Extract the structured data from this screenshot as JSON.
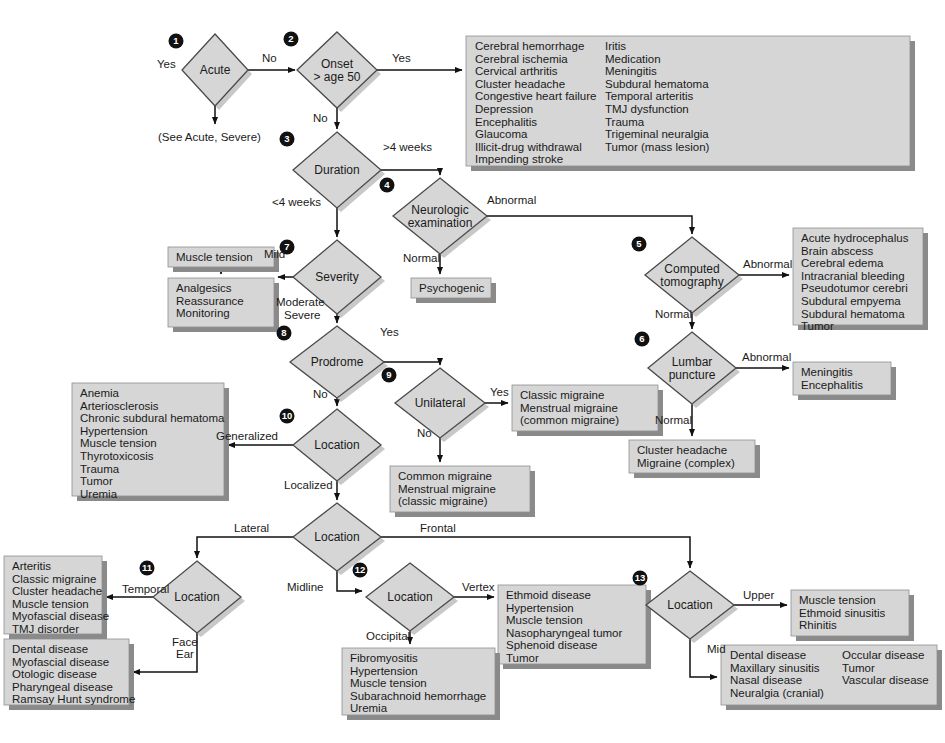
{
  "colors": {
    "shape_fill": "#d6d6d6",
    "shadow": "#8a8a8a",
    "line": "#111111",
    "badge": "#111111",
    "text": "#1a1a1a"
  },
  "diagram": {
    "type": "clinical-decision-flowchart",
    "nodes": [
      {
        "id": "acute",
        "num": "1",
        "label_lines": [
          "Acute"
        ],
        "cx": 215,
        "cy": 70,
        "rx": 33,
        "ry": 36
      },
      {
        "id": "onset",
        "num": "2",
        "label_lines": [
          "Onset",
          "> age 50"
        ],
        "cx": 337,
        "cy": 70,
        "rx": 40,
        "ry": 38
      },
      {
        "id": "duration",
        "num": "3",
        "label_lines": [
          "Duration"
        ],
        "cx": 337,
        "cy": 170,
        "rx": 44,
        "ry": 38
      },
      {
        "id": "neuro",
        "num": "4",
        "label_lines": [
          "Neurologic",
          "examination"
        ],
        "cx": 440,
        "cy": 216,
        "rx": 47,
        "ry": 38
      },
      {
        "id": "ct",
        "num": "5",
        "label_lines": [
          "Computed",
          "tomography"
        ],
        "cx": 692,
        "cy": 275,
        "rx": 47,
        "ry": 38
      },
      {
        "id": "lp",
        "num": "6",
        "label_lines": [
          "Lumbar",
          "puncture"
        ],
        "cx": 692,
        "cy": 368,
        "rx": 44,
        "ry": 36
      },
      {
        "id": "severity",
        "num": "7",
        "label_lines": [
          "Severity"
        ],
        "cx": 337,
        "cy": 277,
        "rx": 44,
        "ry": 37
      },
      {
        "id": "prodrome",
        "num": "8",
        "label_lines": [
          "Prodrome"
        ],
        "cx": 337,
        "cy": 362,
        "rx": 47,
        "ry": 36
      },
      {
        "id": "unilateral",
        "num": "9",
        "label_lines": [
          "Unilateral"
        ],
        "cx": 440,
        "cy": 403,
        "rx": 45,
        "ry": 35
      },
      {
        "id": "location10",
        "num": "10",
        "label_lines": [
          "Location"
        ],
        "cx": 337,
        "cy": 445,
        "rx": 44,
        "ry": 36
      },
      {
        "id": "location_mid",
        "num": "",
        "label_lines": [
          "Location"
        ],
        "cx": 337,
        "cy": 537,
        "rx": 44,
        "ry": 34
      },
      {
        "id": "location11",
        "num": "11",
        "label_lines": [
          "Location"
        ],
        "cx": 197,
        "cy": 597,
        "rx": 44,
        "ry": 36
      },
      {
        "id": "location12",
        "num": "12",
        "label_lines": [
          "Location"
        ],
        "cx": 410,
        "cy": 597,
        "rx": 44,
        "ry": 34
      },
      {
        "id": "location13",
        "num": "13",
        "label_lines": [
          "Location"
        ],
        "cx": 690,
        "cy": 605,
        "rx": 44,
        "ry": 34
      }
    ],
    "edge_labels": [
      {
        "id": "acute-yes",
        "text": "Yes",
        "x": 157,
        "y": 68
      },
      {
        "id": "acute-no",
        "text": "No",
        "x": 262,
        "y": 62
      },
      {
        "id": "onset-yes",
        "text": "Yes",
        "x": 392,
        "y": 62
      },
      {
        "id": "onset-no",
        "text": "No",
        "x": 313,
        "y": 122
      },
      {
        "id": "duration-gt4",
        "text": ">4 weeks",
        "x": 383,
        "y": 151
      },
      {
        "id": "duration-lt4",
        "text": "<4 weeks",
        "x": 272,
        "y": 206
      },
      {
        "id": "neuro-abnormal",
        "text": "Abnormal",
        "x": 487,
        "y": 204
      },
      {
        "id": "neuro-normal",
        "text": "Normal",
        "x": 403,
        "y": 262
      },
      {
        "id": "ct-abnormal",
        "text": "Abnormal",
        "x": 743,
        "y": 268
      },
      {
        "id": "ct-normal",
        "text": "Normal",
        "x": 655,
        "y": 318
      },
      {
        "id": "lp-abnormal",
        "text": "Abnormal",
        "x": 742,
        "y": 361
      },
      {
        "id": "lp-normal",
        "text": "Normal",
        "x": 655,
        "y": 424
      },
      {
        "id": "severity-mild",
        "text": "Mild",
        "x": 264,
        "y": 258
      },
      {
        "id": "severity-moderate",
        "text": "Moderate",
        "x": 276,
        "y": 306
      },
      {
        "id": "severity-severe",
        "text": "Severe",
        "x": 284,
        "y": 319
      },
      {
        "id": "prodrome-yes",
        "text": "Yes",
        "x": 380,
        "y": 336
      },
      {
        "id": "prodrome-no",
        "text": "No",
        "x": 313,
        "y": 398
      },
      {
        "id": "unilateral-yes",
        "text": "Yes",
        "x": 490,
        "y": 396
      },
      {
        "id": "unilateral-no",
        "text": "No",
        "x": 417,
        "y": 437
      },
      {
        "id": "loc10-generalized",
        "text": "Generalized",
        "x": 216,
        "y": 440
      },
      {
        "id": "loc10-localized",
        "text": "Localized",
        "x": 284,
        "y": 489
      },
      {
        "id": "locmid-lateral",
        "text": "Lateral",
        "x": 234,
        "y": 532
      },
      {
        "id": "locmid-frontal",
        "text": "Frontal",
        "x": 420,
        "y": 532
      },
      {
        "id": "locmid-midline",
        "text": "Midline",
        "x": 287,
        "y": 591
      },
      {
        "id": "loc11-temporal",
        "text": "Temporal",
        "x": 122,
        "y": 593
      },
      {
        "id": "loc11-face",
        "text": "Face",
        "x": 172,
        "y": 646
      },
      {
        "id": "loc11-ear",
        "text": "Ear",
        "x": 176,
        "y": 658
      },
      {
        "id": "loc12-vertex",
        "text": "Vertex",
        "x": 462,
        "y": 591
      },
      {
        "id": "loc12-occipital",
        "text": "Occipital",
        "x": 366,
        "y": 640
      },
      {
        "id": "loc13-upper",
        "text": "Upper",
        "x": 743,
        "y": 599
      },
      {
        "id": "loc13-mid",
        "text": "Mid",
        "x": 707,
        "y": 653
      }
    ],
    "boxes": [
      {
        "id": "see-acute-severe",
        "x": 158,
        "y": 131,
        "w": 0,
        "h": 0,
        "plain": true,
        "lines": [
          "(See Acute, Severe)"
        ]
      },
      {
        "id": "onset-yes-box",
        "x": 466,
        "y": 36,
        "w": 444,
        "h": 130,
        "cols": [
          [
            "Cerebral hemorrhage",
            "Cerebral ischemia",
            "Cervical arthritis",
            "Cluster headache",
            "Congestive heart failure",
            "Depression",
            "Encephalitis",
            "Glaucoma",
            "Illicit-drug withdrawal",
            "Impending stroke"
          ],
          [
            "Iritis",
            "Medication",
            "Meningitis",
            "Subdural hematoma",
            "Temporal arteritis",
            "TMJ dysfunction",
            "Trauma",
            "Trigeminal neuralgia",
            "Tumor (mass lesion)"
          ]
        ],
        "col2x": 130
      },
      {
        "id": "muscle-tension-box",
        "x": 168,
        "y": 247,
        "w": 106,
        "h": 20,
        "lines": [
          "Muscle tension"
        ]
      },
      {
        "id": "analgesics-box",
        "x": 168,
        "y": 278,
        "w": 106,
        "h": 49,
        "lines": [
          "Analgesics",
          "Reassurance",
          "Monitoring"
        ]
      },
      {
        "id": "psychogenic-box",
        "x": 411,
        "y": 278,
        "w": 80,
        "h": 20,
        "lines": [
          "Psychogenic"
        ]
      },
      {
        "id": "ct-abnormal-box",
        "x": 793,
        "y": 228,
        "w": 130,
        "h": 97,
        "lines": [
          "Acute hydrocephalus",
          "Brain abscess",
          "Cerebral edema",
          "Intracranial bleeding",
          "Pseudotumor cerebri",
          "Subdural empyema",
          "Subdural hematoma",
          "Tumor"
        ]
      },
      {
        "id": "lp-abnormal-box",
        "x": 793,
        "y": 362,
        "w": 98,
        "h": 33,
        "lines": [
          "Meningitis",
          "Encephalitis"
        ]
      },
      {
        "id": "lp-normal-box",
        "x": 629,
        "y": 440,
        "w": 126,
        "h": 33,
        "lines": [
          "Cluster headache",
          "Migraine (complex)"
        ]
      },
      {
        "id": "unilateral-yes-box",
        "x": 512,
        "y": 385,
        "w": 146,
        "h": 46,
        "lines": [
          "Classic migraine",
          "Menstrual migraine",
          "   (common migraine)"
        ]
      },
      {
        "id": "unilateral-no-box",
        "x": 390,
        "y": 466,
        "w": 140,
        "h": 46,
        "lines": [
          "Common migraine",
          "Menstrual migraine",
          "  (classic migraine)"
        ]
      },
      {
        "id": "generalized-box",
        "x": 72,
        "y": 383,
        "w": 152,
        "h": 113,
        "lines": [
          "Anemia",
          "Arteriosclerosis",
          "Chronic subdural hematoma",
          "Hypertension",
          "Muscle tension",
          "Thyrotoxicosis",
          "Trauma",
          "Tumor",
          "Uremia"
        ]
      },
      {
        "id": "temporal-box",
        "x": 4,
        "y": 556,
        "w": 98,
        "h": 78,
        "lines": [
          "Arteritis",
          "Classic migraine",
          "Cluster headache",
          "Muscle tension",
          "Myofascial disease",
          "TMJ disorder"
        ]
      },
      {
        "id": "face-ear-box",
        "x": 4,
        "y": 639,
        "w": 125,
        "h": 66,
        "lines": [
          "Dental disease",
          "Myofascial disease",
          "Otologic disease",
          "Pharyngeal disease",
          "Ramsay Hunt syndrome"
        ]
      },
      {
        "id": "vertex-box",
        "x": 498,
        "y": 585,
        "w": 148,
        "h": 79,
        "lines": [
          "Ethmoid disease",
          "Hypertension",
          "Muscle tension",
          "Nasopharyngeal tumor",
          "Sphenoid disease",
          "Tumor"
        ]
      },
      {
        "id": "occipital-box",
        "x": 342,
        "y": 648,
        "w": 153,
        "h": 67,
        "lines": [
          "Fibromyositis",
          "Hypertension",
          "Muscle tension",
          "Subarachnoid hemorrhage",
          "Uremia"
        ]
      },
      {
        "id": "upper-box",
        "x": 791,
        "y": 590,
        "w": 118,
        "h": 46,
        "lines": [
          "Muscle tension",
          "Ethmoid sinusitis",
          "Rhinitis"
        ]
      },
      {
        "id": "mid-box",
        "x": 721,
        "y": 645,
        "w": 216,
        "h": 60,
        "cols": [
          [
            "Dental disease",
            "Maxillary sinusitis",
            "Nasal disease",
            "Neuralgia (cranial)"
          ],
          [
            "Occular disease",
            "Tumor",
            "Vascular disease"
          ]
        ],
        "col2x": 112
      }
    ]
  }
}
